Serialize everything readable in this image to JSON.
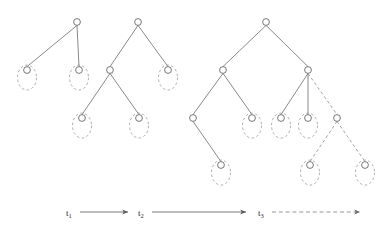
{
  "figure": {
    "title": "",
    "canvas": {
      "width": 386,
      "height": 236
    },
    "colors": {
      "edge_solid": "#6b6b6b",
      "edge_dashed": "#8a8a8a",
      "node_stroke": "#555555",
      "node_fill": "#ffffff",
      "ellipse_stroke": "#9a9a9a",
      "text": "#2b2b2b",
      "background": "#ffffff"
    },
    "style": {
      "node_radius": 3.4,
      "ellipse_rx": 9.5,
      "ellipse_ry": 12.5,
      "edge_width": 0.8,
      "dash_pattern": "3,2.6"
    }
  },
  "trees": [
    {
      "name": "tree-1",
      "nodes": [
        {
          "id": "t1-root",
          "x": 77,
          "y": 22,
          "leaf": false
        },
        {
          "id": "t1-left",
          "x": 27,
          "y": 70,
          "leaf": true
        },
        {
          "id": "t1-right",
          "x": 79,
          "y": 70,
          "leaf": true
        }
      ],
      "edges": [
        {
          "from": "t1-root",
          "to": "t1-left",
          "style": "solid"
        },
        {
          "from": "t1-root",
          "to": "t1-right",
          "style": "solid"
        }
      ]
    },
    {
      "name": "tree-2",
      "nodes": [
        {
          "id": "t2-root",
          "x": 138,
          "y": 22,
          "leaf": false
        },
        {
          "id": "t2-l",
          "x": 110,
          "y": 70,
          "leaf": false
        },
        {
          "id": "t2-r",
          "x": 168,
          "y": 70,
          "leaf": true
        },
        {
          "id": "t2-ll",
          "x": 82,
          "y": 118,
          "leaf": true
        },
        {
          "id": "t2-lr",
          "x": 139,
          "y": 118,
          "leaf": true
        }
      ],
      "edges": [
        {
          "from": "t2-root",
          "to": "t2-l",
          "style": "solid"
        },
        {
          "from": "t2-root",
          "to": "t2-r",
          "style": "solid"
        },
        {
          "from": "t2-l",
          "to": "t2-ll",
          "style": "solid"
        },
        {
          "from": "t2-l",
          "to": "t2-lr",
          "style": "solid"
        }
      ]
    },
    {
      "name": "tree-3",
      "nodes": [
        {
          "id": "t3-root",
          "x": 266,
          "y": 22,
          "leaf": false
        },
        {
          "id": "t3-l",
          "x": 223,
          "y": 70,
          "leaf": false
        },
        {
          "id": "t3-r",
          "x": 308,
          "y": 70,
          "leaf": false
        },
        {
          "id": "t3-ll",
          "x": 193,
          "y": 118,
          "leaf": false
        },
        {
          "id": "t3-lr",
          "x": 252,
          "y": 118,
          "leaf": true
        },
        {
          "id": "t3-rl",
          "x": 281,
          "y": 118,
          "leaf": true
        },
        {
          "id": "t3-rm",
          "x": 308,
          "y": 118,
          "leaf": true
        },
        {
          "id": "t3-rr",
          "x": 337,
          "y": 118,
          "leaf": false
        },
        {
          "id": "t3-lll",
          "x": 221,
          "y": 165,
          "leaf": true
        },
        {
          "id": "t3-rrl",
          "x": 310,
          "y": 165,
          "leaf": true
        },
        {
          "id": "t3-rrr",
          "x": 365,
          "y": 165,
          "leaf": true
        }
      ],
      "edges": [
        {
          "from": "t3-root",
          "to": "t3-l",
          "style": "solid"
        },
        {
          "from": "t3-root",
          "to": "t3-r",
          "style": "solid"
        },
        {
          "from": "t3-l",
          "to": "t3-ll",
          "style": "solid"
        },
        {
          "from": "t3-l",
          "to": "t3-lr",
          "style": "solid"
        },
        {
          "from": "t3-r",
          "to": "t3-rl",
          "style": "solid"
        },
        {
          "from": "t3-r",
          "to": "t3-rm",
          "style": "solid"
        },
        {
          "from": "t3-r",
          "to": "t3-rr",
          "style": "dashed"
        },
        {
          "from": "t3-ll",
          "to": "t3-lll",
          "style": "solid"
        },
        {
          "from": "t3-rr",
          "to": "t3-rrl",
          "style": "dashed"
        },
        {
          "from": "t3-rr",
          "to": "t3-rrr",
          "style": "dashed"
        }
      ]
    }
  ],
  "legend": {
    "items": [
      {
        "label": "t",
        "sub": "1",
        "label_x": 66,
        "label_y": 216,
        "arrow": {
          "x1": 80,
          "y1": 212,
          "x2": 128,
          "y2": 212,
          "style": "solid"
        }
      },
      {
        "label": "t",
        "sub": "2",
        "label_x": 138,
        "label_y": 216,
        "arrow": {
          "x1": 152,
          "y1": 212,
          "x2": 246,
          "y2": 212,
          "style": "solid"
        }
      },
      {
        "label": "t",
        "sub": "3",
        "label_x": 258,
        "label_y": 216,
        "arrow": {
          "x1": 272,
          "y1": 212,
          "x2": 360,
          "y2": 212,
          "style": "dashed"
        }
      }
    ]
  }
}
